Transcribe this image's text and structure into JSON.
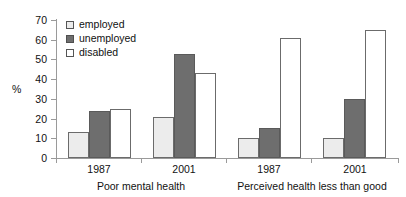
{
  "chart_data": {
    "type": "bar",
    "title": "",
    "xlabel": "",
    "ylabel": "%",
    "ylim": [
      0,
      70
    ],
    "yticks": [
      0,
      10,
      20,
      30,
      40,
      50,
      60,
      70
    ],
    "grid": false,
    "legend_position": "top-left",
    "categories": [
      "1987",
      "2001",
      "1987",
      "2001"
    ],
    "group_labels": [
      "Poor mental health",
      "Perceived health less than good"
    ],
    "series": [
      {
        "name": "employed",
        "values": [
          13,
          21,
          10,
          10
        ],
        "color": "#ececec"
      },
      {
        "name": "unemployed",
        "values": [
          24,
          53,
          15,
          30
        ],
        "color": "#6e6e6e"
      },
      {
        "name": "disabled",
        "values": [
          25,
          43,
          61,
          65
        ],
        "color": "#ffffff"
      }
    ]
  },
  "legend": {
    "items": [
      {
        "label": "employed",
        "key": "employed"
      },
      {
        "label": "unemployed",
        "key": "unemployed"
      },
      {
        "label": "disabled",
        "key": "disabled"
      }
    ]
  },
  "axis": {
    "y_title": "%",
    "y_labels": [
      "70",
      "60",
      "50",
      "40",
      "30",
      "20",
      "10",
      "0"
    ]
  },
  "x_axis": {
    "tick_labels": [
      "1987",
      "2001",
      "1987",
      "2001"
    ],
    "super_labels": [
      "Poor mental health",
      "Perceived health less than good"
    ]
  }
}
